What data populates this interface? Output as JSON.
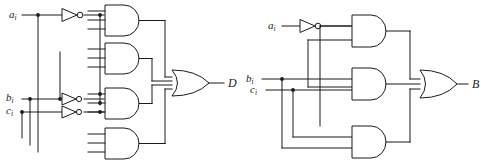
{
  "figure": {
    "kind": "logic-circuit-diagram",
    "background_color": "#ffffff",
    "line_color": "#1b1b1b",
    "width": 481,
    "height": 165
  },
  "circuits": [
    {
      "id": "left",
      "name": "borrow-difference-circuit-D",
      "output": {
        "label": "D",
        "label_sub": ""
      },
      "inputs": [
        {
          "label": "a",
          "sub": "i"
        },
        {
          "label": "b",
          "sub": "i"
        },
        {
          "label": "c",
          "sub": "i"
        }
      ],
      "inverters": [
        {
          "name": "inverter-a",
          "input": "a_i"
        },
        {
          "name": "inverter-b",
          "input": "b_i"
        },
        {
          "name": "inverter-c",
          "input": "c_i"
        }
      ],
      "and_gates": [
        {
          "name": "and-gate-1",
          "inputs": 3,
          "terms": "a_i' b_i' c_i"
        },
        {
          "name": "and-gate-2",
          "inputs": 3,
          "terms": "a_i' b_i c_i'"
        },
        {
          "name": "and-gate-3",
          "inputs": 3,
          "terms": "a_i b_i' c_i'"
        },
        {
          "name": "and-gate-4",
          "inputs": 3,
          "terms": "a_i b_i c_i"
        }
      ],
      "or_gate": {
        "name": "or-gate-d",
        "inputs": 4
      }
    },
    {
      "id": "right",
      "name": "borrow-out-circuit-B",
      "output": {
        "label": "B",
        "label_sub": ""
      },
      "inputs": [
        {
          "label": "a",
          "sub": "i"
        },
        {
          "label": "b",
          "sub": "i"
        },
        {
          "label": "c",
          "sub": "i"
        }
      ],
      "inverters": [
        {
          "name": "inverter-a",
          "input": "a_i"
        }
      ],
      "and_gates": [
        {
          "name": "and-gate-1",
          "inputs": 2,
          "terms": "a_i' c_i"
        },
        {
          "name": "and-gate-2",
          "inputs": 2,
          "terms": "b_i c_i"
        },
        {
          "name": "and-gate-3",
          "inputs": 2,
          "terms": "a_i' b_i"
        }
      ],
      "or_gate": {
        "name": "or-gate-b",
        "inputs": 3
      }
    }
  ],
  "labels": {
    "left_a": "a",
    "left_a_sub": "i",
    "left_b": "b",
    "left_b_sub": "i",
    "left_c": "c",
    "left_c_sub": "i",
    "left_out": "D",
    "right_a": "a",
    "right_a_sub": "i",
    "right_b": "b",
    "right_b_sub": "i",
    "right_c": "c",
    "right_c_sub": "i",
    "right_out": "B"
  }
}
